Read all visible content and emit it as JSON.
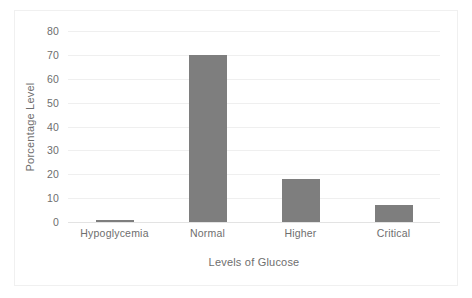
{
  "chart_data": {
    "type": "bar",
    "title": "",
    "categories": [
      "Hypoglycemia",
      "Normal",
      "Higher",
      "Critical"
    ],
    "values": [
      1,
      70,
      18,
      7
    ],
    "xlabel": "Levels of Glucose",
    "ylabel": "Porcentage Level",
    "ylim": [
      0,
      80
    ],
    "yticks": [
      0,
      10,
      20,
      30,
      40,
      50,
      60,
      70,
      80
    ],
    "grid": true,
    "legend": false,
    "bar_color": "#7e7e7e",
    "background_color": "#ffffff"
  }
}
